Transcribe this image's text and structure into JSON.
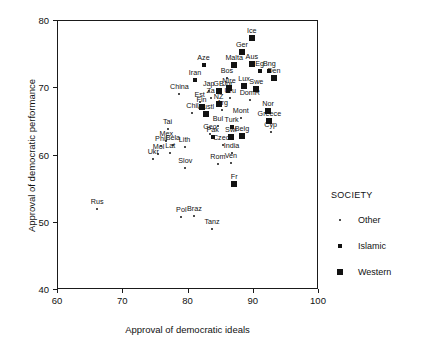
{
  "chart_data": {
    "type": "scatter",
    "title": "",
    "xlabel": "Approval of democratic ideals",
    "ylabel": "Approval of democratic performance",
    "xlim": [
      60,
      100
    ],
    "ylim": [
      40,
      80
    ],
    "xticks": [
      60,
      70,
      80,
      90,
      100
    ],
    "yticks": [
      40,
      50,
      60,
      70,
      80
    ],
    "grid": false,
    "legend": {
      "title": "SOCIETY",
      "position": "right",
      "entries": [
        {
          "label": "Other",
          "marker": "small-dot",
          "size": 2
        },
        {
          "label": "Islamic",
          "marker": "small-square",
          "size": 4
        },
        {
          "label": "Western",
          "marker": "large-square",
          "size": 6
        }
      ]
    },
    "points": [
      {
        "label": "Ice",
        "x": 89.7,
        "y": 77.4,
        "society": "Western"
      },
      {
        "label": "Ger",
        "x": 88.2,
        "y": 75.4,
        "society": "Western"
      },
      {
        "label": "Aus",
        "x": 89.7,
        "y": 73.6,
        "society": "Western"
      },
      {
        "label": "Malta",
        "x": 87.0,
        "y": 73.4,
        "society": "Western"
      },
      {
        "label": "Aze",
        "x": 82.3,
        "y": 73.5,
        "society": "Islamic"
      },
      {
        "label": "Eg",
        "x": 90.9,
        "y": 72.6,
        "society": "Islamic"
      },
      {
        "label": "Bng",
        "x": 92.4,
        "y": 72.6,
        "society": "Islamic"
      },
      {
        "label": "Den",
        "x": 93.1,
        "y": 71.5,
        "society": "Western"
      },
      {
        "label": "Bos",
        "x": 85.9,
        "y": 71.5,
        "society": "Other"
      },
      {
        "label": "NIre",
        "x": 86.2,
        "y": 70.0,
        "society": "Western"
      },
      {
        "label": "Iran",
        "x": 81.0,
        "y": 71.2,
        "society": "Islamic"
      },
      {
        "label": "Jap",
        "x": 83.1,
        "y": 69.6,
        "society": "Other"
      },
      {
        "label": "GB",
        "x": 84.6,
        "y": 69.6,
        "society": "Western"
      },
      {
        "label": "Jor",
        "x": 86.0,
        "y": 69.6,
        "society": "Islamic"
      },
      {
        "label": "Lux",
        "x": 88.5,
        "y": 70.3,
        "society": "Western"
      },
      {
        "label": "Swe",
        "x": 90.4,
        "y": 69.9,
        "society": "Western"
      },
      {
        "label": "China",
        "x": 78.6,
        "y": 69.2,
        "society": "Other"
      },
      {
        "label": "Est",
        "x": 81.7,
        "y": 68.0,
        "society": "Other"
      },
      {
        "label": "Za",
        "x": 83.4,
        "y": 68.6,
        "society": "Other"
      },
      {
        "label": "Uru",
        "x": 86.4,
        "y": 68.5,
        "society": "Other"
      },
      {
        "label": "NZ",
        "x": 84.6,
        "y": 67.6,
        "society": "Western"
      },
      {
        "label": "DomR",
        "x": 89.4,
        "y": 68.2,
        "society": "Other"
      },
      {
        "label": "Fin",
        "x": 82.0,
        "y": 67.2,
        "society": "Western"
      },
      {
        "label": "Arg",
        "x": 85.2,
        "y": 66.7,
        "society": "Other"
      },
      {
        "label": "Chil",
        "x": 80.6,
        "y": 66.3,
        "society": "Other"
      },
      {
        "label": "Austl",
        "x": 82.7,
        "y": 66.2,
        "society": "Western"
      },
      {
        "label": "Nor",
        "x": 92.2,
        "y": 66.6,
        "society": "Western"
      },
      {
        "label": "Mont",
        "x": 88.0,
        "y": 65.6,
        "society": "Other"
      },
      {
        "label": "Greece",
        "x": 92.4,
        "y": 65.1,
        "society": "Western"
      },
      {
        "label": "Cyp",
        "x": 92.6,
        "y": 63.5,
        "society": "Other"
      },
      {
        "label": "Tai",
        "x": 76.8,
        "y": 64.0,
        "society": "Other"
      },
      {
        "label": "Geo",
        "x": 83.3,
        "y": 63.2,
        "society": "Other"
      },
      {
        "label": "Bul",
        "x": 84.5,
        "y": 64.4,
        "society": "Other"
      },
      {
        "label": "Turk",
        "x": 86.6,
        "y": 64.2,
        "society": "Islamic"
      },
      {
        "label": "Pak",
        "x": 83.7,
        "y": 62.8,
        "society": "Islamic"
      },
      {
        "label": "Swi",
        "x": 86.5,
        "y": 62.8,
        "society": "Western"
      },
      {
        "label": "Belg",
        "x": 88.2,
        "y": 62.9,
        "society": "Western"
      },
      {
        "label": "Mex",
        "x": 76.6,
        "y": 62.2,
        "society": "Other"
      },
      {
        "label": "Phil",
        "x": 75.8,
        "y": 61.4,
        "society": "Other"
      },
      {
        "label": "Bela",
        "x": 77.6,
        "y": 61.5,
        "society": "Other"
      },
      {
        "label": "Lith",
        "x": 79.4,
        "y": 61.3,
        "society": "Other"
      },
      {
        "label": "Czech",
        "x": 85.3,
        "y": 61.5,
        "society": "Other"
      },
      {
        "label": "India",
        "x": 86.6,
        "y": 60.3,
        "society": "Other"
      },
      {
        "label": "Mol",
        "x": 75.4,
        "y": 60.2,
        "society": "Other"
      },
      {
        "label": "Lat",
        "x": 77.2,
        "y": 60.3,
        "society": "Other"
      },
      {
        "label": "Ukr",
        "x": 74.6,
        "y": 59.5,
        "society": "Other"
      },
      {
        "label": "Rom",
        "x": 84.5,
        "y": 58.8,
        "society": "Other"
      },
      {
        "label": "Ven",
        "x": 86.5,
        "y": 58.9,
        "society": "Other"
      },
      {
        "label": "Slov",
        "x": 79.5,
        "y": 58.2,
        "society": "Other"
      },
      {
        "label": "Fr",
        "x": 87.0,
        "y": 55.8,
        "society": "Western"
      },
      {
        "label": "Rus",
        "x": 66.0,
        "y": 52.0,
        "society": "Other"
      },
      {
        "label": "Pol",
        "x": 78.9,
        "y": 50.8,
        "society": "Other"
      },
      {
        "label": "Braz",
        "x": 80.9,
        "y": 51.0,
        "society": "Other"
      },
      {
        "label": "Tanz",
        "x": 83.6,
        "y": 49.0,
        "society": "Other"
      }
    ]
  }
}
